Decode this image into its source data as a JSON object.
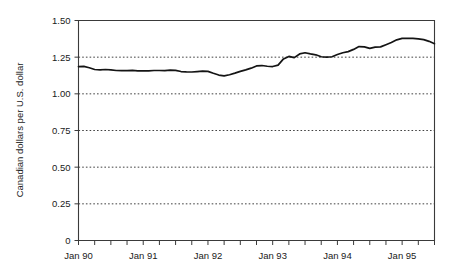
{
  "chart_data": {
    "type": "line",
    "title": "",
    "xlabel": "",
    "ylabel": "Canadian dollars per U.S. dollar",
    "ylim": [
      0,
      1.5
    ],
    "yticks": [
      0,
      0.25,
      0.5,
      0.75,
      1.0,
      1.25,
      1.5
    ],
    "ytick_labels": [
      "0",
      "0.25",
      "0.50",
      "0.75",
      "1.00",
      "1.25",
      "1.50"
    ],
    "xtick_labels": [
      "Jan 90",
      "Jan 91",
      "Jan 92",
      "Jan 93",
      "Jan 94",
      "Jan 95"
    ],
    "xtick_values": [
      0,
      12,
      24,
      36,
      48,
      60
    ],
    "xlim": [
      0,
      66
    ],
    "minor_tick_interval_months": 3,
    "grid": "horizontal-dotted",
    "legend": "none",
    "series": [
      {
        "name": "CAD per USD",
        "x": [
          0,
          1,
          2,
          3,
          4,
          5,
          6,
          7,
          8,
          9,
          10,
          11,
          12,
          13,
          14,
          15,
          16,
          17,
          18,
          19,
          20,
          21,
          22,
          23,
          24,
          25,
          26,
          27,
          28,
          29,
          30,
          31,
          32,
          33,
          34,
          35,
          36,
          37,
          38,
          39,
          40,
          41,
          42,
          43,
          44,
          45,
          46,
          47,
          48,
          49,
          50,
          51,
          52,
          53,
          54,
          55,
          56,
          57,
          58,
          59,
          60,
          61,
          62,
          63,
          64,
          65,
          66
        ],
        "values": [
          1.185,
          1.187,
          1.178,
          1.166,
          1.163,
          1.166,
          1.163,
          1.159,
          1.158,
          1.158,
          1.16,
          1.157,
          1.156,
          1.157,
          1.159,
          1.159,
          1.158,
          1.161,
          1.16,
          1.152,
          1.15,
          1.149,
          1.152,
          1.155,
          1.153,
          1.14,
          1.128,
          1.122,
          1.13,
          1.141,
          1.153,
          1.163,
          1.175,
          1.19,
          1.193,
          1.188,
          1.186,
          1.196,
          1.238,
          1.255,
          1.247,
          1.272,
          1.28,
          1.272,
          1.266,
          1.253,
          1.25,
          1.253,
          1.268,
          1.28,
          1.288,
          1.303,
          1.322,
          1.32,
          1.31,
          1.318,
          1.32,
          1.335,
          1.35,
          1.368,
          1.378,
          1.378,
          1.378,
          1.375,
          1.37,
          1.358,
          1.342
        ]
      }
    ]
  },
  "axes": {
    "y_title": "Canadian dollars per U.S. dollar",
    "y_labels": [
      "1.50",
      "1.25",
      "1.00",
      "0.75",
      "0.50",
      "0.25",
      "0"
    ],
    "x_labels": [
      "Jan 90",
      "Jan 91",
      "Jan 92",
      "Jan 93",
      "Jan 94",
      "Jan 95"
    ]
  },
  "colors": {
    "series_line": "#141414",
    "frame": "#3a3a3a",
    "gridline": "#2b2b2b",
    "text": "#1a1a1a",
    "background": "#ffffff"
  }
}
